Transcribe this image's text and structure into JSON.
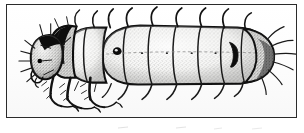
{
  "figure": {
    "style": "pen-and-ink stipple line drawing",
    "orientation": "lateral, head at left, abdomen at right",
    "frame": {
      "border_color": "#2b2b2b",
      "background_color": "#ffffff",
      "border_width_px": 1.5
    },
    "ink_color": "#111111",
    "stipple_color": "#3a3a3a",
    "body_fill": "#f2f2f0"
  },
  "anatomy": {
    "head": {
      "label": "head capsule",
      "eye_label": "eye spot",
      "shading": "dark sclerotized with stipple",
      "setae_count": 9
    },
    "thorax": {
      "label": "thorax",
      "segment_count": 3,
      "plate_label": "pronotal plate",
      "leg_pairs": 3
    },
    "abdomen": {
      "label": "abdomen",
      "segment_count": 8,
      "spiracle_label": "spiracle",
      "texture": "dense stipple"
    },
    "terminal": {
      "label": "terminal segment",
      "marking_label": "crescent marking",
      "setae_count": 6
    }
  },
  "setae": {
    "dorsal_label": "dorsal setae",
    "ventral_label": "ventral setae",
    "dorsal_count": 9,
    "ventral_count": 8
  },
  "artifacts": {
    "caption_ghost_left": "",
    "caption_ghost_right": ""
  }
}
